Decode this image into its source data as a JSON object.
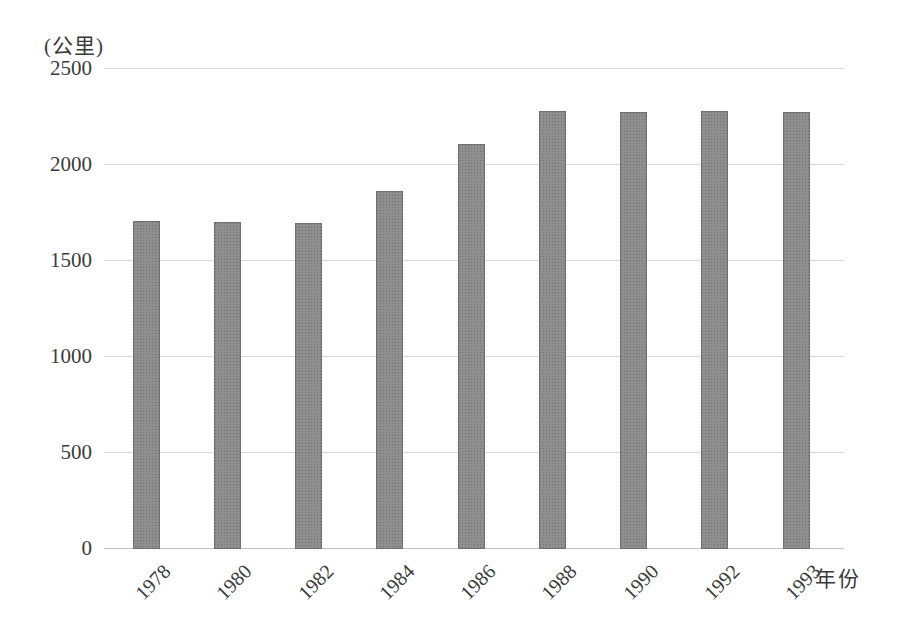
{
  "chart_data": {
    "type": "bar",
    "title": "",
    "unit_label": "(公里)",
    "xlabel": "年份",
    "categories": [
      "1978",
      "1980",
      "1982",
      "1984",
      "1986",
      "1988",
      "1990",
      "1992",
      "1993"
    ],
    "values": [
      1710,
      1705,
      1700,
      1865,
      2110,
      2280,
      2275,
      2280,
      2275
    ],
    "ylim": [
      0,
      2500
    ],
    "ytick_interval": 500,
    "yticks": [
      2500,
      2000,
      1500,
      1000,
      500,
      0
    ],
    "grid": true,
    "legend": "none",
    "bar_color": "#8f8f8f",
    "gridline_color": "#d9d9d9",
    "text_color": "#3a3a3a",
    "background_color": "#ffffff"
  }
}
